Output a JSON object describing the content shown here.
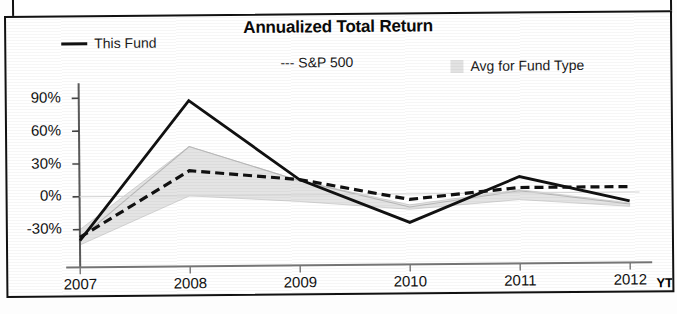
{
  "chart_data": {
    "type": "line",
    "title": "Annualized Total Return",
    "xlabel": "",
    "ylabel": "",
    "categories": [
      "2007",
      "2008",
      "2009",
      "2010",
      "2011",
      "2012"
    ],
    "x_axis_note": "YTD",
    "ytick_labels": [
      "90%",
      "60%",
      "30%",
      "0%",
      "-30%"
    ],
    "ytick_values": [
      90,
      60,
      30,
      0,
      -30
    ],
    "ylim": [
      -48,
      100
    ],
    "grid": false,
    "legend_position": "top",
    "series": [
      {
        "name": "This Fund",
        "style": "solid-line",
        "values": [
          -40,
          87,
          14,
          -26,
          15,
          -8
        ]
      },
      {
        "name": "S&P 500",
        "style": "dashed-line",
        "values": [
          -37,
          23,
          14,
          -5,
          5,
          5
        ]
      },
      {
        "name": "Avg for Fund Type",
        "style": "shaded-band",
        "values": [
          -38,
          45,
          13,
          -12,
          2,
          -11
        ],
        "band_upper": [
          -30,
          45,
          13,
          -10,
          3,
          -10
        ],
        "band_lower": [
          -44,
          0,
          -6,
          -14,
          -6,
          -13
        ]
      }
    ]
  },
  "legend": {
    "this_fund": "This Fund",
    "sp500": "--- S&P 500",
    "avg_fund_type": "Avg for Fund Type"
  }
}
